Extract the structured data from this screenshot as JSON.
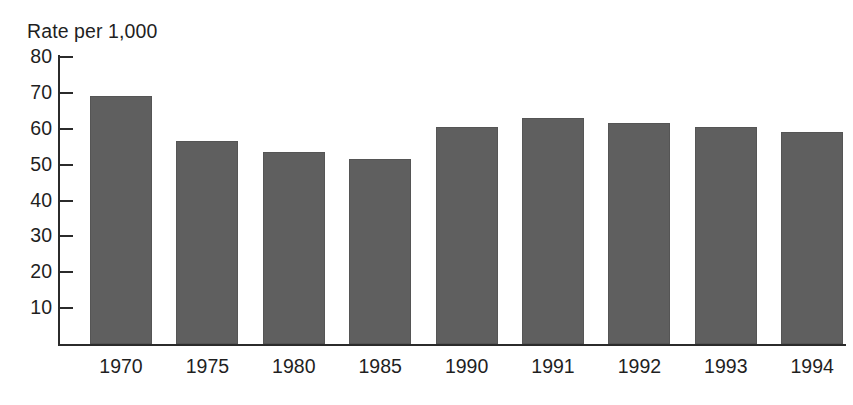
{
  "chart_data": {
    "type": "bar",
    "title": "Rate per 1,000",
    "xlabel": "",
    "ylabel": "Rate per 1,000",
    "categories": [
      "1970",
      "1975",
      "1980",
      "1985",
      "1990",
      "1991",
      "1992",
      "1993",
      "1994"
    ],
    "values": [
      69,
      56.5,
      53.5,
      51.5,
      60.5,
      63,
      61.5,
      60.5,
      59
    ],
    "ylim": [
      0,
      80
    ],
    "yticks": [
      80,
      70,
      60,
      50,
      40,
      30,
      20,
      10
    ],
    "ytick_labels": [
      "80",
      "70",
      "60",
      "50",
      "40",
      "30",
      "20",
      "10"
    ],
    "grid": false,
    "legend": false,
    "legend_position": "none",
    "series": [
      {
        "name": "Rate per 1,000",
        "values": [
          69,
          56.5,
          53.5,
          51.5,
          60.5,
          63,
          61.5,
          60.5,
          59
        ]
      }
    ],
    "bar_color": "#5f5f5f",
    "bar_edge_color": "#555555",
    "axis_color": "#2b2b2b",
    "background_color": "#ffffff"
  }
}
